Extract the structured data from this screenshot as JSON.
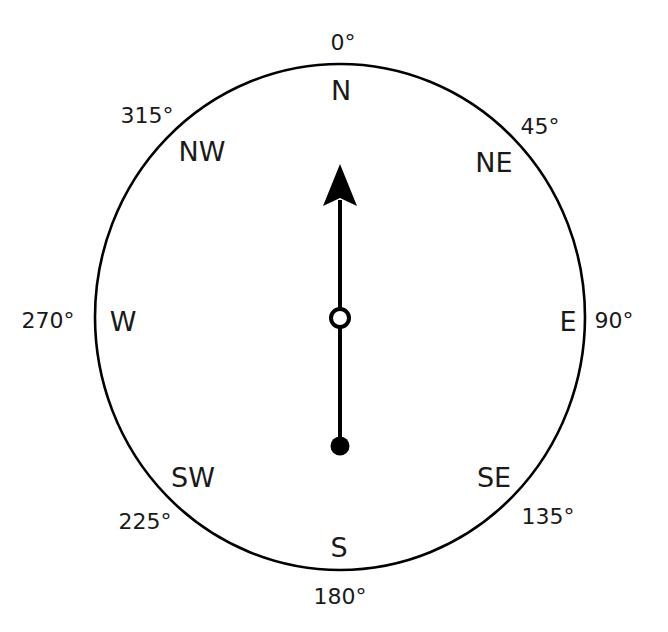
{
  "diagram": {
    "type": "compass",
    "colors": {
      "stroke": "#000000",
      "text": "#1a1a1a",
      "background": "#ffffff"
    },
    "needle": {
      "direction": "N",
      "heading_degrees": 0
    },
    "directions": {
      "n": {
        "label": "N",
        "degrees": "0°"
      },
      "ne": {
        "label": "NE",
        "degrees": "45°"
      },
      "e": {
        "label": "E",
        "degrees": "90°"
      },
      "se": {
        "label": "SE",
        "degrees": "135°"
      },
      "s": {
        "label": "S",
        "degrees": "180°"
      },
      "sw": {
        "label": "SW",
        "degrees": "225°"
      },
      "w": {
        "label": "W",
        "degrees": "270°"
      },
      "nw": {
        "label": "NW",
        "degrees": "315°"
      }
    }
  }
}
